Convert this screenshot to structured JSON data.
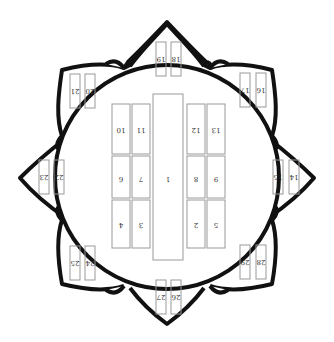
{
  "diagram": {
    "type": "lotus-seating-plan",
    "colors": {
      "outline": "#111111",
      "box": "#999999",
      "text": "#333333",
      "background": "#ffffff"
    },
    "center": {
      "label": "1",
      "boxes": [
        {
          "id": "1",
          "label": "1"
        },
        {
          "id": "2",
          "label": "2"
        },
        {
          "id": "3",
          "label": "3"
        },
        {
          "id": "4",
          "label": "4"
        },
        {
          "id": "5",
          "label": "5"
        },
        {
          "id": "6",
          "label": "6"
        },
        {
          "id": "7",
          "label": "7"
        },
        {
          "id": "8",
          "label": "8"
        },
        {
          "id": "9",
          "label": "9"
        },
        {
          "id": "10",
          "label": "10"
        },
        {
          "id": "11",
          "label": "11"
        },
        {
          "id": "12",
          "label": "12"
        },
        {
          "id": "13",
          "label": "13"
        }
      ]
    },
    "petals": [
      {
        "position": "top",
        "labels": [
          "19",
          "18"
        ]
      },
      {
        "position": "top-right",
        "labels": [
          "17",
          "16"
        ]
      },
      {
        "position": "right",
        "labels": [
          "15",
          "14"
        ]
      },
      {
        "position": "bottom-right",
        "labels": [
          "29",
          "28"
        ]
      },
      {
        "position": "bottom",
        "labels": [
          "27",
          "26"
        ]
      },
      {
        "position": "bottom-left",
        "labels": [
          "25",
          "24"
        ]
      },
      {
        "position": "left",
        "labels": [
          "23",
          "22"
        ]
      },
      {
        "position": "top-left",
        "labels": [
          "21",
          "20"
        ]
      }
    ]
  }
}
